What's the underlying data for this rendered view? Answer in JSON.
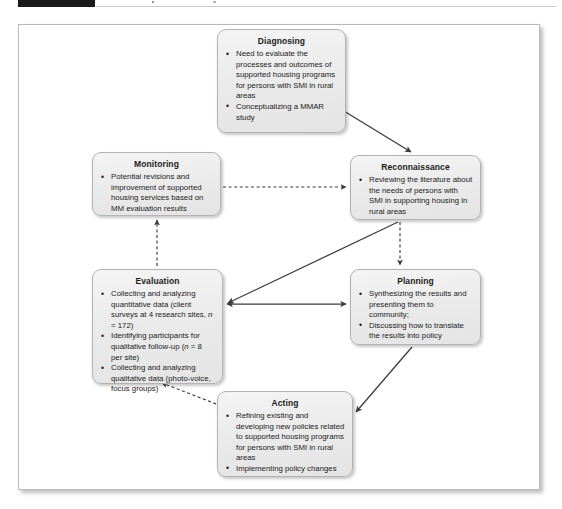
{
  "header": {
    "tab_label": "",
    "dot_a": "",
    "dot_b": ""
  },
  "figure": {
    "nodes": [
      {
        "id": "diagnosing",
        "title": "Diagnosing",
        "bullets": [
          "Need to evaluate the processes and outcomes of supported housing programs for persons with SMI in rural areas",
          "Conceptualizing a MMAR study"
        ]
      },
      {
        "id": "reconnaissance",
        "title": "Reconnaissance",
        "bullets": [
          "Reviewing the literature about the needs of persons with SMI in supporting housing in rural areas"
        ]
      },
      {
        "id": "monitoring",
        "title": "Monitoring",
        "bullets": [
          "Potential revisions and improvement of supported housing services based on MM evaluation results"
        ]
      },
      {
        "id": "evaluation",
        "title": "Evaluation",
        "bullets": [
          "Collecting and analyzing quantitative data (client surveys at 4 research sites, n = 172)",
          "Identifying participants for qualitative follow-up (n = 8 per site)",
          "Collecting and analyzing qualitative data (photo-voice, focus groups)"
        ]
      },
      {
        "id": "planning",
        "title": "Planning",
        "bullets": [
          "Synthesizing the results and presenting them to community;",
          "Discussing how to translate the results into policy"
        ]
      },
      {
        "id": "acting",
        "title": "Acting",
        "bullets": [
          "Refining existing and developing new policies related to supported housing programs for persons with SMI in rural areas",
          "Implementing policy changes"
        ]
      }
    ],
    "connectors": [
      {
        "id": "diagnosing-to-reconnaissance",
        "from": "diagnosing",
        "to": "reconnaissance",
        "style": "solid",
        "heads": "single"
      },
      {
        "id": "monitoring-to-reconnaissance",
        "from": "monitoring",
        "to": "reconnaissance",
        "style": "dashed",
        "heads": "single"
      },
      {
        "id": "reconnaissance-to-planning",
        "from": "reconnaissance",
        "to": "planning",
        "style": "dashed",
        "heads": "single"
      },
      {
        "id": "reconnaissance-to-evaluation",
        "from": "reconnaissance",
        "to": "evaluation",
        "style": "solid",
        "heads": "single"
      },
      {
        "id": "evaluation-to-planning",
        "from": "evaluation",
        "to": "planning",
        "style": "solid",
        "heads": "double"
      },
      {
        "id": "evaluation-to-monitoring",
        "from": "evaluation",
        "to": "monitoring",
        "style": "dashed",
        "heads": "single"
      },
      {
        "id": "planning-to-acting",
        "from": "planning",
        "to": "acting",
        "style": "solid",
        "heads": "single"
      },
      {
        "id": "acting-to-evaluation",
        "from": "acting",
        "to": "evaluation",
        "style": "dashed",
        "heads": "single"
      }
    ],
    "colors": {
      "box_fill": "#ebebeb",
      "box_border": "#b3b3b3",
      "connector": "#3b3b3b",
      "frame_border": "#b9b9b9",
      "text": "#1b1b1b",
      "page_background": "#ffffff"
    }
  }
}
